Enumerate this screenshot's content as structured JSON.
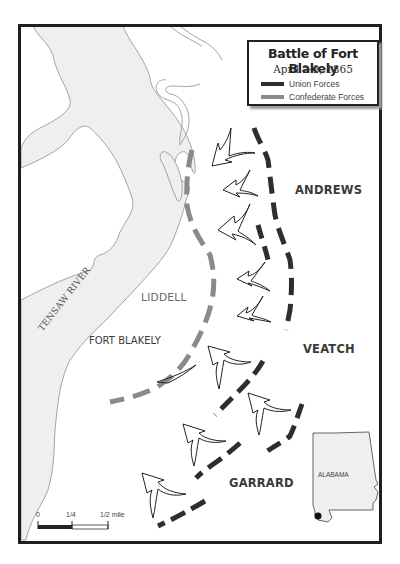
{
  "title": "Battle of Fort Blakely",
  "date": "April 2-9, 1865",
  "legend": {
    "items": [
      {
        "label": "Union Forces",
        "color": "#2e2e2e"
      },
      {
        "label": "Confederate Forces",
        "color": "#8a8a8a"
      }
    ]
  },
  "labels": {
    "river": "TENSAW RIVER",
    "fort": "FORT BLAKELY",
    "confederate_commander": "LIDDELL",
    "union_commanders": [
      "ANDREWS",
      "VEATCH",
      "GARRARD"
    ],
    "inset_state": "ALABAMA"
  },
  "scale_bar": {
    "ticks": [
      "0",
      "1/4",
      "1/2 mile"
    ]
  },
  "colors": {
    "water": "#efefef",
    "shoreline": "#9a9a9a",
    "union": "#2e2e2e",
    "confederate": "#8a8a8a",
    "frame": "#1e1e1e"
  }
}
